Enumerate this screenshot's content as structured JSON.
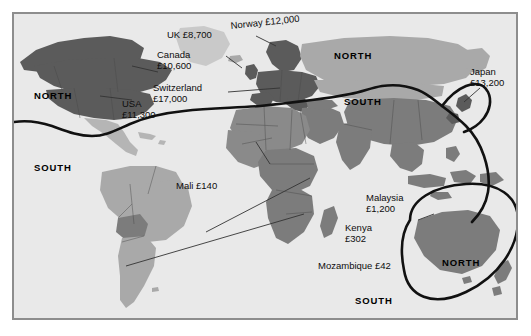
{
  "figure": {
    "type": "thematic-world-map"
  },
  "colors": {
    "ocean": "#e9e9e9",
    "frame_border": "#8d8d8d",
    "divide_line": "#111111",
    "land_dark": "#5b5b5b",
    "land_mid": "#7c7c7c",
    "land_light": "#a9a9a9",
    "land_pale": "#c9c9c9",
    "text": "#111111"
  },
  "region_labels": [
    {
      "id": "north-america",
      "text": "NORTH"
    },
    {
      "id": "south-america",
      "text": "SOUTH"
    },
    {
      "id": "eurasia-north",
      "text": "NORTH"
    },
    {
      "id": "asia-south",
      "text": "SOUTH"
    },
    {
      "id": "indian-ocean-south",
      "text": "SOUTH"
    },
    {
      "id": "australia-north",
      "text": "NORTH"
    }
  ],
  "country_labels": [
    {
      "id": "uk",
      "name": "UK",
      "value": "£8,700",
      "inline": "UK £8,700"
    },
    {
      "id": "norway",
      "name": "Norway",
      "value": "£12,000",
      "inline": "Norway £12,000"
    },
    {
      "id": "canada",
      "name": "Canada",
      "value": "£10,600",
      "inline": "Canada £10,600"
    },
    {
      "id": "switzerland",
      "name": "Switzerland",
      "value": "£17,000",
      "inline": "Switzerland £17,000"
    },
    {
      "id": "usa",
      "name": "USA",
      "value": "£11,300",
      "inline": "USA £11,300"
    },
    {
      "id": "japan",
      "name": "Japan",
      "value": "£13,200",
      "inline": "Japan £13,200"
    },
    {
      "id": "mali",
      "name": "Mali",
      "value": "£140",
      "inline": "Mali £140"
    },
    {
      "id": "malaysia",
      "name": "Malaysia",
      "value": "£1,200",
      "inline": "Malaysia £1,200"
    },
    {
      "id": "kenya",
      "name": "Kenya",
      "value": "£302",
      "inline": "Kenya £302"
    },
    {
      "id": "mozambique",
      "name": "Mozambique",
      "value": "£42",
      "inline": "Mozambique £42"
    }
  ]
}
